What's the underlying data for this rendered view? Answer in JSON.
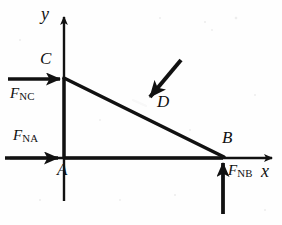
{
  "figure": {
    "background_color": "#fefefe",
    "ink_color": "#111111",
    "axes": {
      "x_label": "x",
      "y_label": "y",
      "origin_label": "A"
    },
    "points": [
      {
        "name": "A",
        "label": "A",
        "x": 64,
        "y": 158
      },
      {
        "name": "B",
        "label": "B",
        "x": 223,
        "y": 158
      },
      {
        "name": "C",
        "label": "C",
        "x": 64,
        "y": 78
      },
      {
        "name": "D",
        "label": "D",
        "x": 148,
        "y": 100
      }
    ],
    "forces": [
      {
        "name": "F_NC",
        "symbol": "F",
        "subscript": "NC",
        "label": "F_NC",
        "direction": "right",
        "applied_at": "C"
      },
      {
        "name": "F_NA",
        "symbol": "F",
        "subscript": "NA",
        "label": "F_NA",
        "direction": "right",
        "applied_at": "A"
      },
      {
        "name": "F_NB",
        "symbol": "F",
        "subscript": "NB",
        "label": "F_NB",
        "direction": "up",
        "applied_at": "B"
      },
      {
        "name": "F_D",
        "symbol": "",
        "subscript": "",
        "label": "D",
        "direction": "down-left",
        "applied_at": "D"
      }
    ],
    "members": [
      {
        "name": "member-AB",
        "from": "A",
        "to": "B"
      },
      {
        "name": "member-AC",
        "from": "A",
        "to": "C"
      },
      {
        "name": "member-CB",
        "from": "C",
        "to": "B"
      }
    ]
  }
}
